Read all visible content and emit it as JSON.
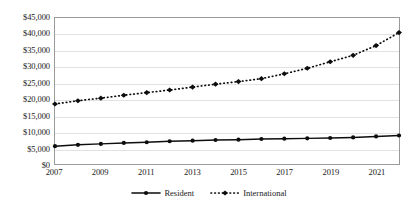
{
  "chart_data": {
    "type": "line",
    "title": "",
    "subtitle": "",
    "xlabel": "",
    "ylabel": "",
    "x": [
      2007,
      2008,
      2009,
      2010,
      2011,
      2012,
      2013,
      2014,
      2015,
      2016,
      2017,
      2018,
      2019,
      2020,
      2021,
      2022
    ],
    "categories": [
      "2007",
      "2008",
      "2009",
      "2010",
      "2011",
      "2012",
      "2013",
      "2014",
      "2015",
      "2016",
      "2017",
      "2018",
      "2019",
      "2020",
      "2021",
      "2022"
    ],
    "xlim": [
      2007,
      2022
    ],
    "ylim": [
      0,
      45000
    ],
    "ytick_step": 5000,
    "xtick_labels": [
      "2007",
      "2009",
      "2011",
      "2013",
      "2015",
      "2017",
      "2019",
      "2021"
    ],
    "xtick_values": [
      2007,
      2009,
      2011,
      2013,
      2015,
      2017,
      2019,
      2021
    ],
    "ytick_labels": [
      "$0",
      "$5,000",
      "$10,000",
      "$15,000",
      "$20,000",
      "$25,000",
      "$30,000",
      "$35,000",
      "$40,000",
      "$45,000"
    ],
    "ytick_values": [
      0,
      5000,
      10000,
      15000,
      20000,
      25000,
      30000,
      35000,
      40000,
      45000
    ],
    "grid": "horizontal",
    "legend_position": "bottom-center",
    "series": [
      {
        "name": "Resident",
        "line_style": "solid",
        "marker": "circle",
        "color": "#0d0d0d",
        "values": [
          5500,
          5900,
          6200,
          6500,
          6700,
          7000,
          7200,
          7400,
          7500,
          7700,
          7800,
          7900,
          8000,
          8200,
          8500,
          8800
        ]
      },
      {
        "name": "International",
        "line_style": "dotted",
        "marker": "diamond",
        "color": "#0d0d0d",
        "values": [
          18500,
          19500,
          20300,
          21200,
          22000,
          22800,
          23700,
          24600,
          25400,
          26300,
          27800,
          29500,
          31500,
          33500,
          36500,
          40500
        ]
      }
    ]
  },
  "legend": {
    "entries": [
      {
        "label": "Resident"
      },
      {
        "label": "International"
      }
    ]
  }
}
